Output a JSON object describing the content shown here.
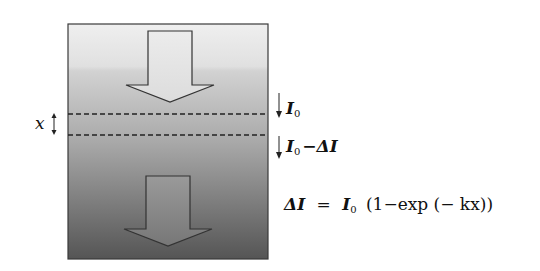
{
  "diagram": {
    "type": "absorption-through-medium",
    "medium": {
      "gradient_top_color": "#ececec",
      "gradient_bottom_color": "#5a5a5a",
      "border_color": "#333333"
    },
    "arrows": [
      {
        "name": "incident-light-arrow",
        "fill": "#e6e6e6"
      },
      {
        "name": "transmitted-light-arrow",
        "fill": "#8a8a8a"
      }
    ],
    "thickness_label": "x",
    "layer_labels": {
      "top": {
        "symbol": "I",
        "subscript": "0"
      },
      "bottom": {
        "symbol": "I",
        "subscript": "0",
        "suffix": "−ΔI"
      }
    },
    "equation": {
      "lhs": "ΔI",
      "equals": "=",
      "symbol": "I",
      "subscript": "0",
      "rhs": "(1−exp (− kx))"
    }
  }
}
